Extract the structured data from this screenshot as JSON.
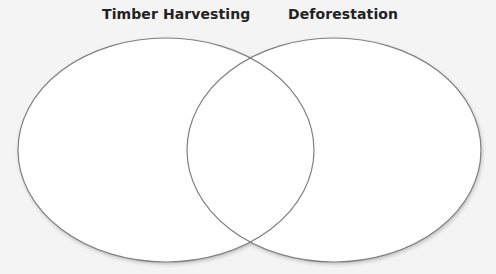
{
  "diagram": {
    "type": "venn",
    "sets": [
      {
        "label": "Timber Harvesting"
      },
      {
        "label": "Deforestation"
      }
    ],
    "stroke_color": "#808080",
    "background_color": "#f4f4f4",
    "fill_color": "#ffffff"
  }
}
